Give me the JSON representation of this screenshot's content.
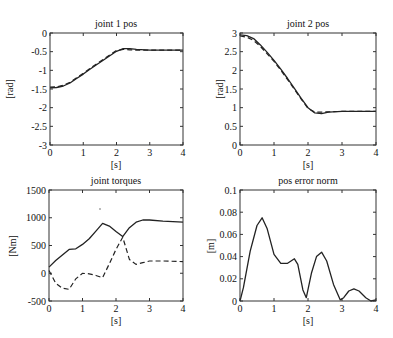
{
  "chart_data": [
    {
      "id": "p1",
      "type": "line",
      "title": "joint 1 pos",
      "xlabel": "[s]",
      "ylabel": "[rad]",
      "xlim": [
        0,
        4
      ],
      "ylim": [
        -3,
        0
      ],
      "xticks": [
        0,
        1,
        2,
        3,
        4
      ],
      "yticks": [
        0,
        -0.5,
        -1,
        -1.5,
        -2,
        -2.5,
        -3
      ],
      "ytick_labels": [
        "0",
        "-0.5",
        "-1",
        "-1.5",
        "-2",
        "-2.5",
        "-3"
      ],
      "grid": false,
      "frame": {
        "x": 50,
        "y": 33,
        "w": 133,
        "h": 112
      },
      "series": [
        {
          "name": "actual",
          "style": "solid",
          "x": [
            0,
            0.2,
            0.4,
            0.6,
            0.8,
            1.0,
            1.2,
            1.4,
            1.6,
            1.8,
            2.0,
            2.2,
            2.4,
            2.6,
            3.0,
            3.5,
            4.0
          ],
          "y": [
            -1.47,
            -1.46,
            -1.42,
            -1.34,
            -1.22,
            -1.1,
            -0.97,
            -0.85,
            -0.73,
            -0.61,
            -0.49,
            -0.42,
            -0.42,
            -0.44,
            -0.46,
            -0.46,
            -0.46
          ]
        },
        {
          "name": "reference",
          "style": "dashed",
          "x": [
            0,
            0.2,
            0.4,
            0.6,
            0.8,
            1.0,
            1.2,
            1.4,
            1.6,
            1.8,
            2.0,
            2.2,
            2.4,
            2.6,
            3.0,
            3.5,
            4.0
          ],
          "y": [
            -1.45,
            -1.44,
            -1.4,
            -1.32,
            -1.2,
            -1.08,
            -0.95,
            -0.83,
            -0.71,
            -0.59,
            -0.47,
            -0.44,
            -0.45,
            -0.46,
            -0.46,
            -0.46,
            -0.46
          ]
        }
      ]
    },
    {
      "id": "p2",
      "type": "line",
      "title": "joint 2 pos",
      "xlabel": "[s]",
      "ylabel": "[rad]",
      "xlim": [
        0,
        4
      ],
      "ylim": [
        0,
        3
      ],
      "xticks": [
        0,
        1,
        2,
        3,
        4
      ],
      "yticks": [
        3,
        2.5,
        2,
        1.5,
        1,
        0.5,
        0
      ],
      "ytick_labels": [
        "3",
        "2.5",
        "2",
        "1.5",
        "1",
        "0.5",
        "0"
      ],
      "grid": false,
      "frame": {
        "x": 240,
        "y": 33,
        "w": 136,
        "h": 112
      },
      "series": [
        {
          "name": "actual",
          "style": "solid",
          "x": [
            0,
            0.2,
            0.4,
            0.6,
            0.8,
            1.0,
            1.2,
            1.4,
            1.6,
            1.8,
            2.0,
            2.2,
            2.4,
            2.6,
            3.0,
            3.5,
            4.0
          ],
          "y": [
            2.95,
            2.93,
            2.85,
            2.68,
            2.48,
            2.27,
            2.03,
            1.78,
            1.52,
            1.25,
            1.0,
            0.86,
            0.84,
            0.88,
            0.9,
            0.9,
            0.9
          ]
        },
        {
          "name": "reference",
          "style": "dashed",
          "x": [
            0,
            0.2,
            0.4,
            0.6,
            0.8,
            1.0,
            1.2,
            1.4,
            1.6,
            1.8,
            2.0,
            2.2,
            2.4,
            2.6,
            3.0,
            3.5,
            4.0
          ],
          "y": [
            2.92,
            2.89,
            2.8,
            2.64,
            2.44,
            2.24,
            2.0,
            1.75,
            1.49,
            1.23,
            0.98,
            0.88,
            0.88,
            0.89,
            0.9,
            0.9,
            0.9
          ]
        }
      ]
    },
    {
      "id": "p3",
      "type": "line",
      "title": "joint torques",
      "xlabel": "[s]",
      "ylabel": "[Nm]",
      "xlim": [
        0,
        4
      ],
      "ylim": [
        -500,
        1500
      ],
      "xticks": [
        0,
        1,
        2,
        3,
        4
      ],
      "yticks": [
        1500,
        1000,
        500,
        0,
        -500
      ],
      "ytick_labels": [
        "1500",
        "1000",
        "500",
        "0",
        "-500"
      ],
      "grid": false,
      "frame": {
        "x": 49,
        "y": 190,
        "w": 134,
        "h": 111
      },
      "series": [
        {
          "name": "joint 1 torque",
          "style": "solid",
          "x": [
            0,
            0.2,
            0.4,
            0.6,
            0.8,
            1.0,
            1.2,
            1.4,
            1.6,
            1.8,
            2.0,
            2.2,
            2.4,
            2.6,
            2.8,
            3.0,
            3.4,
            4.0
          ],
          "y": [
            110,
            230,
            330,
            430,
            440,
            520,
            620,
            760,
            900,
            850,
            750,
            660,
            820,
            920,
            960,
            960,
            940,
            920
          ]
        },
        {
          "name": "joint 2 torque",
          "style": "dashed",
          "x": [
            0,
            0.2,
            0.4,
            0.6,
            0.8,
            1.0,
            1.2,
            1.4,
            1.6,
            1.8,
            2.0,
            2.2,
            2.4,
            2.6,
            2.8,
            3.0,
            3.4,
            4.0
          ],
          "y": [
            50,
            -180,
            -270,
            -290,
            -100,
            0,
            -10,
            -40,
            -80,
            170,
            430,
            650,
            250,
            160,
            190,
            220,
            220,
            210
          ]
        }
      ]
    },
    {
      "id": "p4",
      "type": "line",
      "title": "pos error norm",
      "xlabel": "[s]",
      "ylabel": "[m]",
      "xlim": [
        0,
        4
      ],
      "ylim": [
        0,
        0.1
      ],
      "xticks": [
        0,
        1,
        2,
        3,
        4
      ],
      "yticks": [
        0.1,
        0.08,
        0.06,
        0.04,
        0.02,
        0
      ],
      "ytick_labels": [
        "0.1",
        "0.08",
        "0.06",
        "0.04",
        "0.02",
        "0"
      ],
      "grid": false,
      "frame": {
        "x": 240,
        "y": 190,
        "w": 136,
        "h": 111
      },
      "series": [
        {
          "name": "error norm",
          "style": "solid",
          "x": [
            0,
            0.1,
            0.3,
            0.5,
            0.65,
            0.8,
            1.0,
            1.2,
            1.4,
            1.6,
            1.7,
            1.85,
            1.95,
            2.1,
            2.25,
            2.4,
            2.55,
            2.75,
            2.95,
            3.05,
            3.2,
            3.35,
            3.5,
            3.7,
            3.85,
            4.0
          ],
          "y": [
            0,
            0.012,
            0.045,
            0.068,
            0.075,
            0.065,
            0.042,
            0.034,
            0.034,
            0.038,
            0.033,
            0.01,
            0.003,
            0.025,
            0.04,
            0.044,
            0.036,
            0.015,
            0.001,
            0.003,
            0.009,
            0.011,
            0.009,
            0.003,
            0.0,
            0.001
          ]
        }
      ]
    }
  ]
}
